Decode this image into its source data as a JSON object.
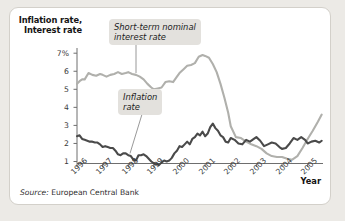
{
  "figure": {
    "axis_title_line1": "Inflation rate,",
    "axis_title_line2": "Interest rate",
    "x_axis_title": "Year",
    "source_prefix": "Source:",
    "source_text": "European Central Bank",
    "callout_interest_line1": "Short-term nominal",
    "callout_interest_line2": "interest rate",
    "callout_inflation_line1": "Inflation",
    "callout_inflation_line2": "rate",
    "colors": {
      "interest_rate_line": "#b0b0ac",
      "inflation_rate_line": "#4a4a4a",
      "axis": "#6e6e6e",
      "panel_background": "#ffffff",
      "page_background": "#eceae6",
      "callout_background": "#e3e1dd"
    }
  },
  "chart_data": {
    "type": "line",
    "title": "",
    "xlabel": "Year",
    "ylabel": "Inflation rate, Interest rate",
    "ylim": [
      0,
      7.5
    ],
    "xlim": [
      1996.0,
      2005.6
    ],
    "grid": false,
    "legend": "annotations-on-plot",
    "ytick_labels": [
      "7%",
      "6",
      "5",
      "4",
      "3",
      "2",
      "1"
    ],
    "ytick_values": [
      7,
      6,
      5,
      4,
      3,
      2,
      1
    ],
    "xtick_labels": [
      "1996",
      "1997",
      "1998",
      "1999",
      "2000",
      "2001",
      "2002",
      "2003",
      "2004",
      "2005"
    ],
    "xtick_values": [
      1996,
      1997,
      1998,
      1999,
      2000,
      2001,
      2002,
      2003,
      2004,
      2005
    ],
    "series": [
      {
        "name": "Short-term nominal interest rate",
        "color": "#b0b0ac",
        "x": [
          1996.0,
          1996.1,
          1996.2,
          1996.3,
          1996.45,
          1996.6,
          1996.75,
          1996.9,
          1997.0,
          1997.15,
          1997.3,
          1997.45,
          1997.6,
          1997.75,
          1997.9,
          1998.0,
          1998.15,
          1998.3,
          1998.45,
          1998.6,
          1998.75,
          1998.9,
          1999.0,
          1999.15,
          1999.3,
          1999.45,
          1999.6,
          1999.75,
          1999.9,
          2000.0,
          2000.15,
          2000.3,
          2000.45,
          2000.6,
          2000.75,
          2000.9,
          2001.0,
          2001.15,
          2001.3,
          2001.45,
          2001.6,
          2001.75,
          2001.9,
          2002.0,
          2002.2,
          2002.4,
          2002.6,
          2002.8,
          2003.0,
          2003.2,
          2003.4,
          2003.6,
          2003.8,
          2004.0,
          2004.2,
          2004.4,
          2004.6,
          2004.8,
          2005.0,
          2005.2,
          2005.4,
          2005.55
        ],
        "y": [
          5.3,
          5.45,
          5.55,
          5.55,
          5.9,
          5.8,
          5.75,
          5.85,
          5.8,
          5.7,
          5.8,
          5.85,
          5.95,
          5.85,
          5.9,
          5.95,
          5.85,
          5.8,
          5.7,
          5.55,
          5.3,
          5.1,
          5.0,
          5.05,
          5.1,
          5.4,
          5.45,
          5.4,
          5.7,
          5.9,
          6.1,
          6.3,
          6.35,
          6.45,
          6.8,
          6.9,
          6.85,
          6.75,
          6.4,
          5.95,
          5.3,
          4.55,
          3.7,
          2.95,
          2.35,
          2.3,
          2.1,
          1.95,
          1.85,
          1.7,
          1.45,
          1.3,
          1.25,
          1.25,
          1.15,
          1.1,
          1.3,
          1.75,
          2.25,
          2.7,
          3.2,
          3.6
        ]
      },
      {
        "name": "Inflation rate",
        "color": "#4a4a4a",
        "x": [
          1996.0,
          1996.1,
          1996.2,
          1996.3,
          1996.4,
          1996.5,
          1996.6,
          1996.7,
          1996.8,
          1996.9,
          1997.0,
          1997.1,
          1997.2,
          1997.3,
          1997.4,
          1997.5,
          1997.6,
          1997.7,
          1997.8,
          1997.9,
          1998.0,
          1998.1,
          1998.2,
          1998.3,
          1998.4,
          1998.5,
          1998.6,
          1998.7,
          1998.8,
          1998.9,
          1999.0,
          1999.1,
          1999.2,
          1999.3,
          1999.4,
          1999.5,
          1999.6,
          1999.7,
          1999.8,
          1999.9,
          2000.0,
          2000.1,
          2000.2,
          2000.3,
          2000.4,
          2000.5,
          2000.6,
          2000.7,
          2000.8,
          2000.9,
          2001.0,
          2001.1,
          2001.2,
          2001.3,
          2001.4,
          2001.5,
          2001.6,
          2001.7,
          2001.8,
          2001.9,
          2002.0,
          2002.15,
          2002.3,
          2002.45,
          2002.6,
          2002.75,
          2002.9,
          2003.0,
          2003.15,
          2003.3,
          2003.45,
          2003.6,
          2003.75,
          2003.9,
          2004.0,
          2004.15,
          2004.3,
          2004.45,
          2004.6,
          2004.75,
          2004.9,
          2005.0,
          2005.15,
          2005.3,
          2005.45,
          2005.55
        ],
        "y": [
          2.4,
          2.45,
          2.25,
          2.2,
          2.15,
          2.1,
          2.1,
          2.05,
          2.05,
          1.95,
          1.8,
          1.85,
          1.8,
          1.75,
          1.75,
          1.6,
          1.4,
          1.35,
          1.45,
          1.45,
          1.35,
          1.3,
          1.1,
          1.05,
          1.35,
          1.35,
          1.4,
          1.3,
          1.15,
          1.0,
          0.9,
          0.85,
          0.8,
          0.95,
          1.05,
          1.0,
          1.05,
          1.2,
          1.45,
          1.6,
          1.85,
          1.8,
          1.95,
          2.1,
          1.95,
          2.25,
          2.35,
          2.55,
          2.45,
          2.65,
          2.4,
          2.55,
          2.9,
          3.1,
          2.85,
          2.7,
          2.45,
          2.35,
          2.1,
          2.05,
          2.3,
          2.2,
          2.0,
          1.95,
          2.2,
          2.1,
          2.25,
          2.35,
          2.15,
          1.85,
          1.95,
          2.05,
          2.0,
          1.8,
          1.7,
          1.75,
          2.0,
          2.3,
          2.2,
          2.35,
          2.2,
          2.0,
          2.1,
          2.15,
          2.05,
          2.15
        ]
      }
    ]
  }
}
